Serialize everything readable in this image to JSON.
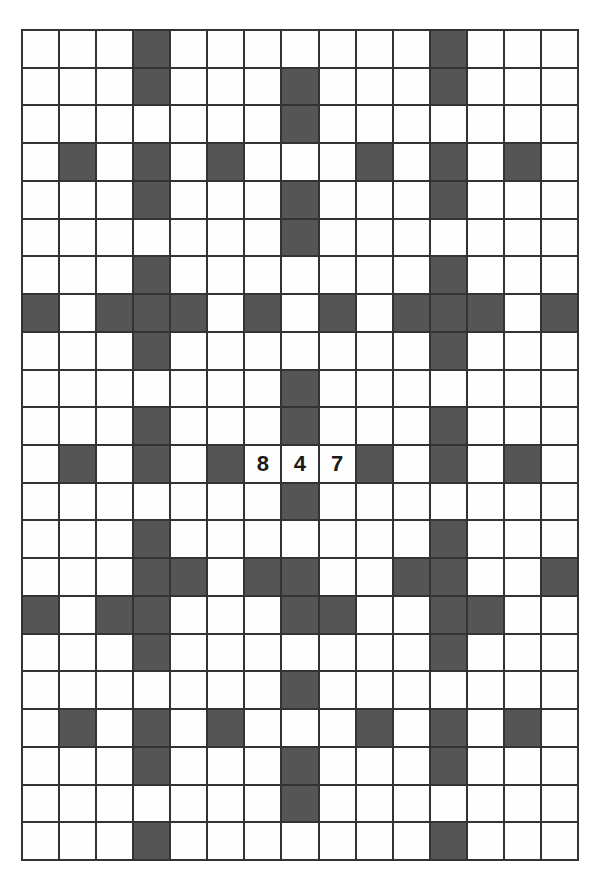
{
  "puzzle": {
    "type": "number-crossword",
    "rows": 22,
    "cols": 15,
    "colors": {
      "block": "#555555",
      "cell": "#fefefe",
      "grid_line": "#333333",
      "digit": "#1a1a1a"
    },
    "blocks": [
      [
        3,
        11
      ],
      [
        3,
        7,
        11
      ],
      [
        7
      ],
      [
        1,
        3,
        5,
        9,
        11,
        13
      ],
      [
        3,
        7,
        11
      ],
      [
        7
      ],
      [
        3,
        11
      ],
      [
        0,
        2,
        3,
        4,
        6,
        8,
        10,
        11,
        12,
        14
      ],
      [
        3,
        11
      ],
      [
        7
      ],
      [
        3,
        7,
        11
      ],
      [
        1,
        3,
        5,
        9,
        11,
        13
      ],
      [
        7
      ],
      [
        3,
        11
      ],
      [
        3,
        4,
        6,
        7,
        10,
        11,
        14
      ],
      [
        0,
        2,
        3,
        7,
        8,
        11,
        12
      ],
      [
        3,
        11
      ],
      [
        7
      ],
      [
        1,
        3,
        5,
        9,
        11,
        13
      ],
      [
        3,
        7,
        11
      ],
      [
        7
      ],
      [
        3,
        11
      ]
    ],
    "given_digits": [
      {
        "row": 11,
        "col": 6,
        "value": "8"
      },
      {
        "row": 11,
        "col": 7,
        "value": "4"
      },
      {
        "row": 11,
        "col": 8,
        "value": "7"
      }
    ]
  }
}
